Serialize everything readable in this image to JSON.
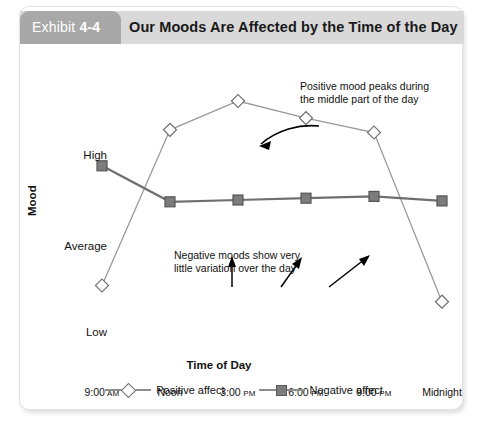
{
  "exhibit": {
    "tab_prefix": "Exhibit",
    "tab_number": "4-4",
    "title": "Our Moods Are Affected by the Time of the Day"
  },
  "annotations": {
    "positive_line1": "Positive mood peaks during",
    "positive_line2": "the middle part of the day",
    "negative_line1": "Negative moods show very",
    "negative_line2": "little variation over the day"
  },
  "legend": {
    "positive_label": "Positive affect",
    "negative_label": "Negative affect",
    "positive_marker": "diamond-marker-icon",
    "negative_marker": "square-marker-icon"
  },
  "source_note": "",
  "chart_data": {
    "type": "line",
    "title": "Our Moods Are Affected by the Time of the Day",
    "xlabel": "Time of Day",
    "ylabel": "Mood",
    "categories": [
      "9:00 AM",
      "Noon",
      "3:00 PM",
      "6:00 PM",
      "9:00 PM",
      "Midnight"
    ],
    "x_tick_main": [
      "9:00",
      "Noon",
      "3:00",
      "6:00",
      "9:00",
      "Midnight"
    ],
    "x_tick_suffix": [
      "AM",
      "",
      "PM",
      "PM",
      "PM",
      ""
    ],
    "ytick_labels": [
      "High",
      "Average",
      "Low"
    ],
    "ytick_values": [
      3.0,
      2.0,
      1.0
    ],
    "ylim": [
      0.75,
      3.35
    ],
    "grid": false,
    "legend_position": "bottom-center",
    "series": [
      {
        "name": "Positive affect",
        "marker": "diamond",
        "color": "#ffffff",
        "line_color": "#9a9a9a",
        "values": [
          1.0,
          2.73,
          3.05,
          2.86,
          2.7,
          0.82
        ]
      },
      {
        "name": "Negative affect",
        "marker": "square",
        "color": "#7c7c7c",
        "line_color": "#6f6f6f",
        "values": [
          2.33,
          1.93,
          1.95,
          1.97,
          1.99,
          1.94
        ]
      }
    ]
  },
  "colors": {
    "tab_background": "#a8a8a8",
    "header_background": "#d9d9d9",
    "plot_background": "#ffffff",
    "positive_line": "#9a9a9a",
    "negative_line": "#6f6f6f",
    "negative_marker_fill": "#7c7c7c",
    "text": "#111111"
  }
}
